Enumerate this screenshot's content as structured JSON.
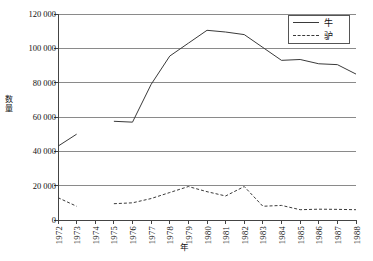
{
  "chart_data": {
    "type": "line",
    "title": "",
    "xlabel": "年",
    "ylabel": "数量",
    "x": [
      1972,
      1973,
      1974,
      1975,
      1976,
      1977,
      1978,
      1979,
      1980,
      1981,
      1982,
      1983,
      1984,
      1985,
      1986,
      1987,
      1988
    ],
    "categories": [
      "1972",
      "1973",
      "1974",
      "1975",
      "1976",
      "1977",
      "1978",
      "1979",
      "1980",
      "1981",
      "1982",
      "1983",
      "1984",
      "1985",
      "1986",
      "1987",
      "1988"
    ],
    "xlim": [
      1972,
      1988
    ],
    "ylim": [
      0,
      120000
    ],
    "yticks": [
      0,
      20000,
      40000,
      60000,
      80000,
      100000,
      120000
    ],
    "ytick_labels": [
      "0",
      "20 000",
      "40 000",
      "60 000",
      "80 000",
      "100 000",
      "120 000"
    ],
    "grid": true,
    "grid_axis": "y",
    "legend_position": "top-right",
    "series": [
      {
        "name": "牛",
        "style": "solid",
        "color": "#3a3a3a",
        "values": [
          43000,
          50000,
          null,
          57500,
          57000,
          79000,
          95500,
          103000,
          110500,
          109500,
          108000,
          100500,
          93000,
          93500,
          91000,
          90500,
          85000
        ]
      },
      {
        "name": "驴",
        "style": "dashed",
        "color": "#3a3a3a",
        "values": [
          13000,
          8000,
          null,
          9500,
          10000,
          12500,
          16000,
          19500,
          16500,
          14000,
          19500,
          8000,
          8500,
          6000,
          6300,
          6200,
          6000
        ]
      }
    ]
  },
  "legend": {
    "items": [
      {
        "label": "牛",
        "style": "solid"
      },
      {
        "label": "驴",
        "style": "dashed"
      }
    ]
  },
  "axis_titles": {
    "y_chars": [
      "数",
      "量"
    ],
    "x": "年"
  }
}
